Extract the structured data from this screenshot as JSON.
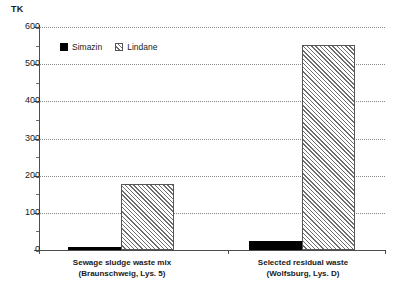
{
  "chart_data": {
    "type": "bar",
    "title": "",
    "unit_label": "TK",
    "xlabel": "",
    "ylabel": "TK",
    "ylim": [
      0,
      600
    ],
    "ytick_step": 100,
    "yminor_step": 50,
    "grid": true,
    "legend_position": "inside-top-left",
    "categories": [
      "Sewage sludge waste mix (Braunschweig, Lys. 5)",
      "Selected residual waste (Wolfsburg, Lys. D)"
    ],
    "category_lines": [
      [
        "Sewage sludge waste mix",
        "(Braunschweig, Lys. 5)"
      ],
      [
        "Selected residual waste",
        "(Wolfsburg, Lys. D)"
      ]
    ],
    "series": [
      {
        "name": "Simazin",
        "color": "#000000",
        "fill": "solid",
        "values": [
          8,
          24
        ]
      },
      {
        "name": "Lindane",
        "color": "#ffffff",
        "fill": "diagonal-hatch",
        "values": [
          178,
          551
        ]
      }
    ],
    "yticks": [
      0,
      100,
      200,
      300,
      400,
      500,
      600
    ],
    "yminor_ticks": [
      50,
      150,
      250,
      350,
      450,
      550
    ]
  },
  "legend": {
    "items": [
      {
        "label": "Simazin"
      },
      {
        "label": "Lindane"
      }
    ]
  }
}
